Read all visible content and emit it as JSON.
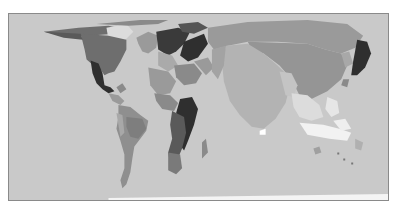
{
  "map": {
    "type": "world cartogram",
    "style": "grayscale",
    "colors": {
      "ocean": "#c9c9c9",
      "frame": "#8a8a8a",
      "darkest": "#2f2f2f",
      "dark": "#555555",
      "medium_dark": "#7a7a7a",
      "medium": "#9a9a9a",
      "light": "#b3b3b3",
      "lighter": "#dcdcdc",
      "white": "#f2f2f2"
    },
    "regions": [
      {
        "name": "north-america-canada-usa",
        "shade": "medium_dark"
      },
      {
        "name": "mexico",
        "shade": "darkest"
      },
      {
        "name": "central-america",
        "shade": "medium"
      },
      {
        "name": "south-america",
        "shade": "medium"
      },
      {
        "name": "europe",
        "shade": "dark"
      },
      {
        "name": "middle-east",
        "shade": "medium"
      },
      {
        "name": "africa",
        "shade": "dark"
      },
      {
        "name": "russia-china-east-asia",
        "shade": "medium"
      },
      {
        "name": "india-subcontinent",
        "shade": "light"
      },
      {
        "name": "japan",
        "shade": "darkest"
      },
      {
        "name": "southeast-asia",
        "shade": "lighter"
      },
      {
        "name": "indonesia-oceania",
        "shade": "white"
      }
    ]
  }
}
